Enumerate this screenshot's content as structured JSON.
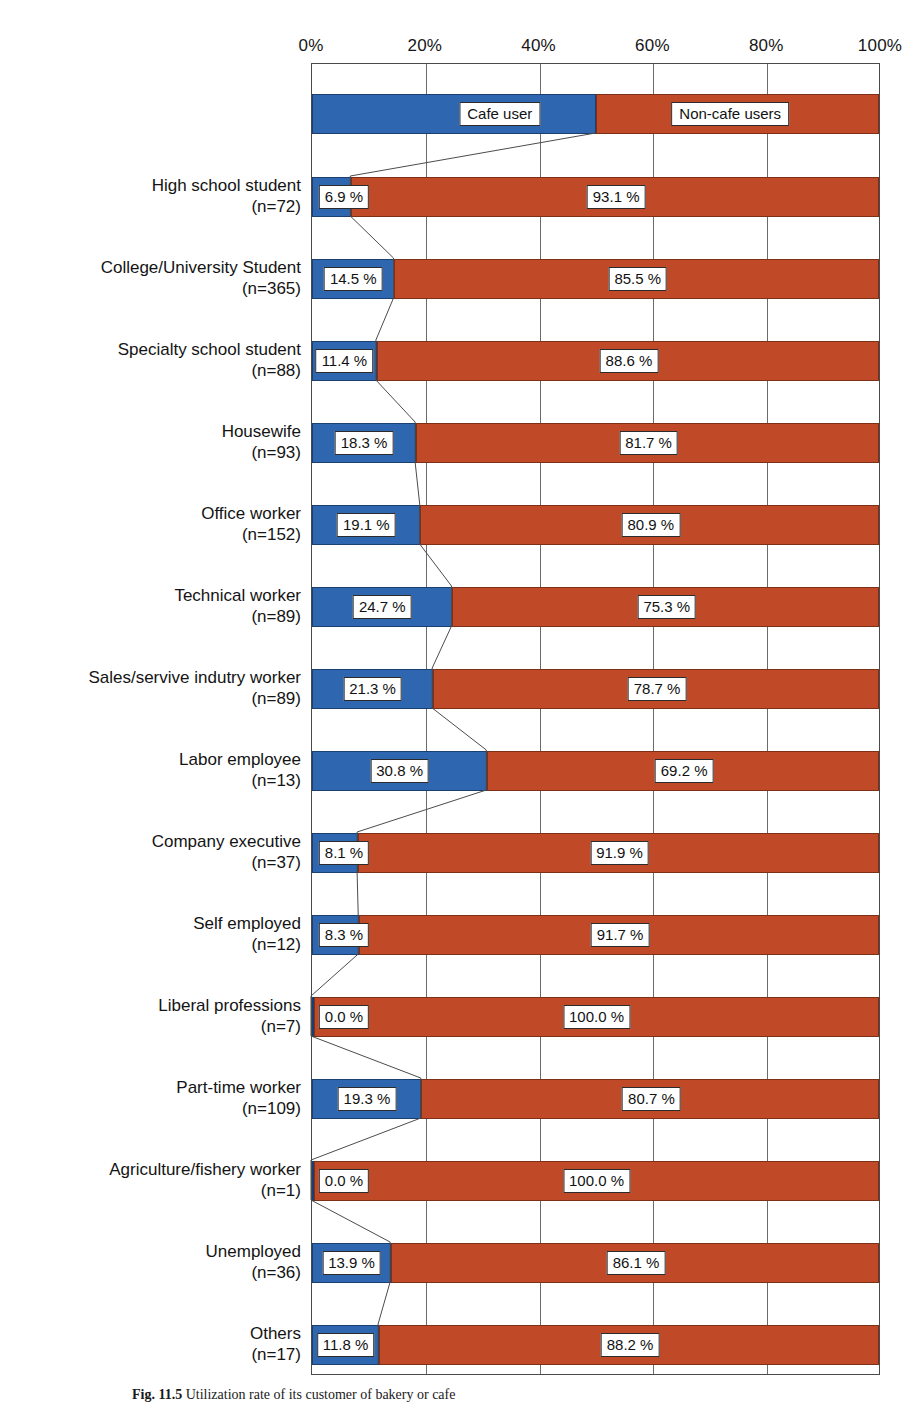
{
  "figure": {
    "caption_number": "Fig. 11.5",
    "caption_text": "Utilization rate of its customer of bakery or cafe"
  },
  "legend": {
    "cafe_label": "Cafe user",
    "noncafe_label": "Non-cafe users",
    "cafe_color": "#2f66b0",
    "noncafe_color": "#c04a28"
  },
  "axis": {
    "ticks": [
      "0%",
      "20%",
      "40%",
      "60%",
      "80%",
      "100%"
    ],
    "tick_values": [
      0,
      20,
      40,
      60,
      80,
      100
    ],
    "min": 0,
    "max": 100
  },
  "chart_data": {
    "type": "bar",
    "orientation": "horizontal",
    "stacked": true,
    "normalized_percent": true,
    "title": "",
    "xlabel": "",
    "ylabel": "",
    "xlim": [
      0,
      100
    ],
    "grid": "vertical",
    "legend_position": "inside-top-bar",
    "tick_labels": [
      "0%",
      "20%",
      "40%",
      "60%",
      "80%",
      "100%"
    ],
    "categories": [
      "High school student",
      "College/University Student",
      "Specialty school student",
      "Housewife",
      "Office worker",
      "Technical worker",
      "Sales/servive indutry worker",
      "Labor employee",
      "Company executive",
      "Self employed",
      "Liberal professions",
      "Part-time worker",
      "Agriculture/fishery worker",
      "Unemployed",
      "Others"
    ],
    "category_n": [
      "(n=72)",
      "(n=365)",
      "(n=88)",
      "(n=93)",
      "(n=152)",
      "(n=89)",
      "(n=89)",
      "(n=13)",
      "(n=37)",
      "(n=12)",
      "(n=7)",
      "(n=109)",
      "(n=1)",
      "(n=36)",
      "(n=17)"
    ],
    "sample_sizes": [
      72,
      365,
      88,
      93,
      152,
      89,
      89,
      13,
      37,
      12,
      7,
      109,
      1,
      36,
      17
    ],
    "series": [
      {
        "name": "Cafe user",
        "color": "#2f66b0",
        "values": [
          6.9,
          14.5,
          11.4,
          18.3,
          19.1,
          24.7,
          21.3,
          30.8,
          8.1,
          8.3,
          0.0,
          19.3,
          0.0,
          13.9,
          11.8
        ],
        "labels": [
          "6.9 %",
          "14.5 %",
          "11.4 %",
          "18.3 %",
          "19.1 %",
          "24.7 %",
          "21.3 %",
          "30.8 %",
          "8.1 %",
          "8.3 %",
          "0.0 %",
          "19.3 %",
          "0.0 %",
          "13.9 %",
          "11.8 %"
        ]
      },
      {
        "name": "Non-cafe users",
        "color": "#c04a28",
        "values": [
          93.1,
          85.5,
          88.6,
          81.7,
          80.9,
          75.3,
          78.7,
          69.2,
          91.9,
          91.7,
          100.0,
          80.7,
          100.0,
          86.1,
          88.2
        ],
        "labels": [
          "93.1 %",
          "85.5 %",
          "88.6 %",
          "81.7 %",
          "80.9 %",
          "75.3 %",
          "78.7 %",
          "69.2 %",
          "91.9 %",
          "91.7 %",
          "100.0 %",
          "80.7 %",
          "100.0 %",
          "86.1 %",
          "88.2 %"
        ]
      }
    ],
    "legend_bar": {
      "cafe_span": 50,
      "noncafe_span": 50
    }
  }
}
